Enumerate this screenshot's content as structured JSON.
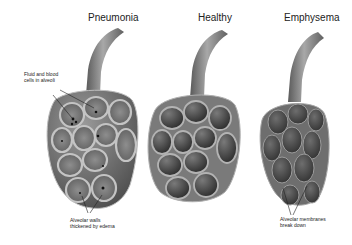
{
  "diagram": {
    "panels": [
      {
        "id": "pneumonia",
        "title": "Pneumonia",
        "annotations": [
          {
            "text_line1": "Fluid and blood",
            "text_line2": "cells in alveoli"
          },
          {
            "text_line1": "Alveolar walls",
            "text_line2": "thickened by edema"
          }
        ]
      },
      {
        "id": "healthy",
        "title": "Healthy",
        "annotations": []
      },
      {
        "id": "emphysema",
        "title": "Emphysema",
        "annotations": [
          {
            "text_line1": "Alveolar membranes",
            "text_line2": "break down"
          }
        ]
      }
    ],
    "colors": {
      "background": "#ffffff",
      "tube_light": "#9a9a9a",
      "tube_dark": "#555555",
      "wall": "#a8a8a8",
      "cell_dark": "#2e2e2e",
      "cell_mid": "#6a6a6a",
      "fluid_dot": "#111111",
      "text": "#222222"
    }
  }
}
